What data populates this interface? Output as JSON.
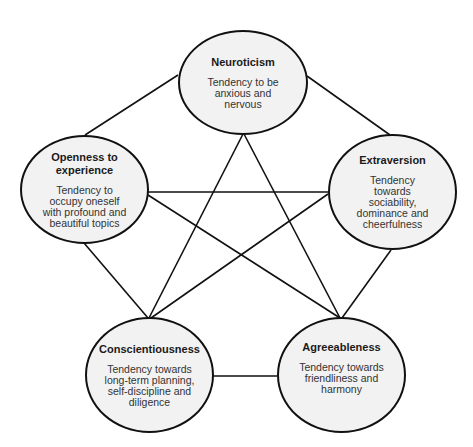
{
  "diagram": {
    "type": "pentagram-network",
    "topic": "Big Five personality traits",
    "colors": {
      "background": "#ffffff",
      "node_fill": "#f2f2f2",
      "stroke": "#111111",
      "text": "#1a1a1a"
    },
    "nodes": [
      {
        "id": "neuroticism",
        "title": "Neuroticism",
        "description": "Tendency to be\nanxious and\nnervous"
      },
      {
        "id": "openness",
        "title": "Openness to\nexperience",
        "description": "Tendency to\noccupy oneself\nwith profound and\nbeautiful topics"
      },
      {
        "id": "extraversion",
        "title": "Extraversion",
        "description": "Tendency\ntowards\nsociability,\ndominance and\ncheerfulness"
      },
      {
        "id": "conscientiousness",
        "title": "Conscientiousness",
        "description": "Tendency towards\nlong-term planning,\nself-discipline and\ndiligence"
      },
      {
        "id": "agreeableness",
        "title": "Agreeableness",
        "description": "Tendency towards\nfriendliness and\nharmony"
      }
    ],
    "edges": [
      [
        "neuroticism",
        "openness"
      ],
      [
        "neuroticism",
        "extraversion"
      ],
      [
        "neuroticism",
        "conscientiousness"
      ],
      [
        "neuroticism",
        "agreeableness"
      ],
      [
        "openness",
        "extraversion"
      ],
      [
        "openness",
        "agreeableness"
      ],
      [
        "openness",
        "conscientiousness"
      ],
      [
        "extraversion",
        "conscientiousness"
      ],
      [
        "extraversion",
        "agreeableness"
      ],
      [
        "conscientiousness",
        "agreeableness"
      ]
    ]
  }
}
